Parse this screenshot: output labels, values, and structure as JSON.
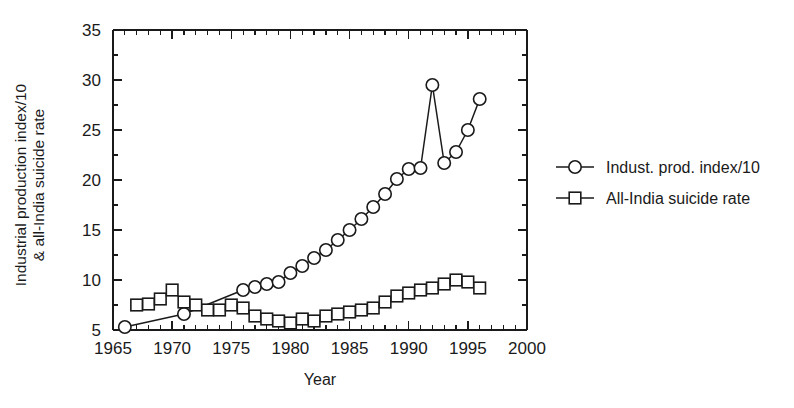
{
  "chart_data": {
    "type": "line",
    "title": "",
    "subtitle": "",
    "xlabel": "Year",
    "ylabel": "Industrial production index/10 & all-India suicide rate",
    "ylabel_line1": "Industrial production index/10",
    "ylabel_line2": "& all-India suicide rate",
    "xlim": [
      1965,
      2000
    ],
    "ylim": [
      5,
      35
    ],
    "x_ticks": [
      1965,
      1970,
      1975,
      1980,
      1985,
      1990,
      1995,
      2000
    ],
    "x_tick_labels": [
      "1965",
      "1970",
      "1975",
      "1980",
      "1985",
      "1990",
      "1995",
      "2000"
    ],
    "x_minor_step": 1,
    "y_ticks": [
      5,
      10,
      15,
      20,
      25,
      30,
      35
    ],
    "y_tick_labels": [
      "5",
      "10",
      "15",
      "20",
      "25",
      "30",
      "35"
    ],
    "y_minor_step": 2.5,
    "grid": false,
    "legend_position": "right",
    "series": [
      {
        "name": "Indust. prod. index/10",
        "marker": "circle",
        "x": [
          1966,
          1971,
          1976,
          1977,
          1978,
          1979,
          1980,
          1981,
          1982,
          1983,
          1984,
          1985,
          1986,
          1987,
          1988,
          1989,
          1990,
          1991,
          1992,
          1993,
          1994,
          1995,
          1996
        ],
        "values": [
          5.3,
          6.6,
          9.0,
          9.3,
          9.6,
          9.8,
          10.7,
          11.4,
          12.2,
          13.0,
          14.0,
          15.0,
          16.1,
          17.3,
          18.6,
          20.1,
          21.1,
          21.2,
          29.5,
          21.7,
          22.8,
          25.0,
          28.1
        ]
      },
      {
        "name": "All-India suicide rate",
        "marker": "square",
        "x": [
          1967,
          1968,
          1969,
          1970,
          1971,
          1972,
          1973,
          1974,
          1975,
          1976,
          1977,
          1978,
          1979,
          1980,
          1981,
          1982,
          1983,
          1984,
          1985,
          1986,
          1987,
          1988,
          1989,
          1990,
          1991,
          1992,
          1993,
          1994,
          1995,
          1996
        ],
        "values": [
          7.5,
          7.6,
          8.1,
          9.0,
          7.8,
          7.5,
          7.0,
          7.0,
          7.5,
          7.2,
          6.4,
          6.1,
          5.9,
          5.7,
          6.1,
          5.9,
          6.4,
          6.6,
          6.8,
          7.0,
          7.2,
          7.8,
          8.4,
          8.7,
          9.0,
          9.2,
          9.6,
          10.0,
          9.8,
          9.2
        ]
      }
    ],
    "legend": [
      {
        "label": "Indust. prod. index/10",
        "marker": "circle"
      },
      {
        "label": "All-India suicide rate",
        "marker": "square"
      }
    ],
    "colors": {
      "ink": "#1a1a1a",
      "background": "#ffffff",
      "marker_fill": "#ffffff"
    }
  }
}
